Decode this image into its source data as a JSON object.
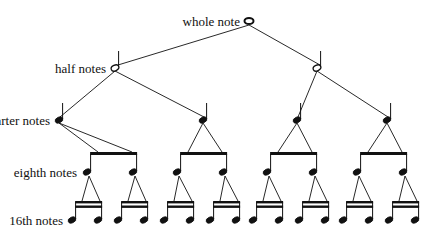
{
  "diagram": {
    "levels": [
      {
        "label": "whole note",
        "y": 21,
        "label_right_x": 240,
        "notes": [
          249
        ]
      },
      {
        "label": "half notes",
        "y": 68,
        "label_right_x": 106,
        "notes": [
          115,
          317
        ]
      },
      {
        "label": "quarter notes",
        "y": 120,
        "label_right_x": 50,
        "notes": [
          59,
          203,
          297,
          387
        ]
      },
      {
        "label": "eighth notes",
        "y": 172,
        "label_right_x": 77,
        "notes": [
          87,
          133,
          177,
          223,
          267,
          313,
          357,
          403
        ]
      },
      {
        "label": "16th notes",
        "y": 220,
        "label_right_x": 63,
        "notes": [
          72,
          98,
          118,
          144,
          164,
          190,
          210,
          236,
          253,
          279,
          299,
          325,
          343,
          369,
          389,
          415
        ]
      }
    ],
    "colors": {
      "ink": "#111111",
      "background": "#ffffff"
    }
  }
}
